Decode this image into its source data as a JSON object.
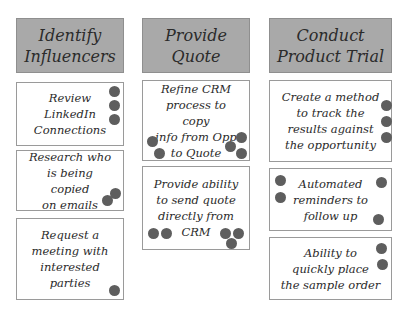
{
  "columns": [
    {
      "header": "Identify\nInfluencers",
      "cards": [
        {
          "text": "Review\nLinkedIn\nConnections",
          "votes": 3
        },
        {
          "text": "Research who\nis being copied\non emails",
          "votes": 2
        },
        {
          "text": "Request a\nmeeting with\ninterested\nparties",
          "votes": 1
        }
      ]
    },
    {
      "header": "Provide\nQuote",
      "cards": [
        {
          "text": "Refine CRM\nprocess to copy\ninfo from Opp\nto Quote",
          "votes": 4
        },
        {
          "text": "Provide ability\nto send quote\ndirectly from\nCRM",
          "votes": 5
        }
      ]
    },
    {
      "header": "Conduct\nProduct Trial",
      "cards": [
        {
          "text": "Create a method\nto track the\nresults against\nthe opportunity",
          "votes": 3
        },
        {
          "text": "Automated\nreminders to\nfollow up",
          "votes": 4
        },
        {
          "text": "Ability to\nquickly place\nthe sample order",
          "votes": 2
        }
      ]
    }
  ],
  "colors": {
    "header_bg": "#a9a9a9",
    "card_bg": "#ffffff",
    "dot": "#5e5e5e"
  }
}
